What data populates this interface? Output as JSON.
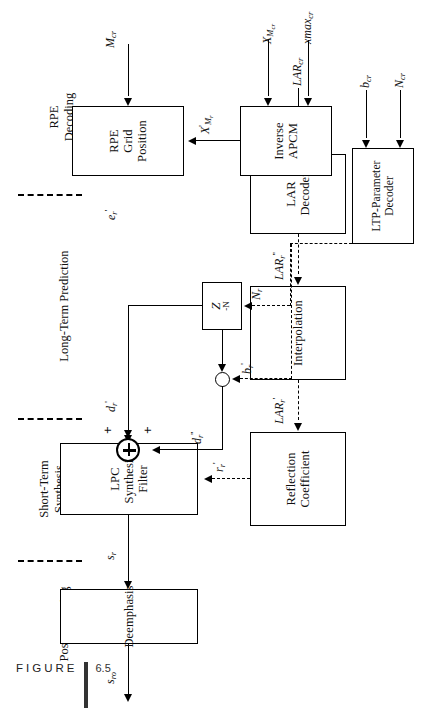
{
  "figure": {
    "caption_word": "FIGURE",
    "caption_number": "6.5",
    "caption_text": "Block Diagram of the RPE-LTP Decoder."
  },
  "sections": [
    {
      "id": "postprocessing",
      "title": "Postprocessing"
    },
    {
      "id": "short-term",
      "title": "Short-Term\nSynthesis\nFiltering"
    },
    {
      "id": "long-term",
      "title": "Long-Term Prediction"
    },
    {
      "id": "rpe-decoding",
      "title": "RPE\nDecoding"
    }
  ],
  "blocks": [
    {
      "id": "deemphasis",
      "lines": [
        "Deemphasis"
      ]
    },
    {
      "id": "lpc-synthesis-filter",
      "lines": [
        "LPC",
        "Synthesis",
        "Filter"
      ]
    },
    {
      "id": "reflection-coefficient",
      "lines": [
        "Reflection",
        "Coefficient"
      ]
    },
    {
      "id": "interpolation",
      "lines": [
        "Interpolation"
      ]
    },
    {
      "id": "lar-decoder",
      "lines": [
        "LAR",
        "Decoder"
      ]
    },
    {
      "id": "delay",
      "lines": [
        "Z^-N"
      ]
    },
    {
      "id": "ltp-parameter-decoder",
      "lines": [
        "LTP-Parameter",
        "Decoder"
      ]
    },
    {
      "id": "rpe-grid-position",
      "lines": [
        "RPE",
        "Grid",
        "Position"
      ]
    },
    {
      "id": "inverse-apcm",
      "lines": [
        "Inverse",
        "APCM"
      ]
    }
  ],
  "signals": {
    "s_ro": {
      "base": "s",
      "sub": "ro",
      "sup": ""
    },
    "s_r": {
      "base": "s",
      "sub": "r",
      "sup": ""
    },
    "d_r1": {
      "base": "d",
      "sub": "r",
      "sup": "'"
    },
    "d_r11": {
      "base": "d",
      "sub": "r",
      "sup": "''"
    },
    "e_r1": {
      "base": "e",
      "sub": "r",
      "sup": "'"
    },
    "r_r1": {
      "base": "r",
      "sub": "r",
      "sup": "'"
    },
    "lar_r1": {
      "base": "LAR",
      "sub": "r",
      "sup": "'"
    },
    "lar_r11": {
      "base": "LAR",
      "sub": "r",
      "sup": "''"
    },
    "lar_cr": {
      "base": "LAR",
      "sub": "cr",
      "sup": ""
    },
    "N_r": {
      "base": "N",
      "sub": "r",
      "sup": ""
    },
    "N_cr": {
      "base": "N",
      "sub": "cr",
      "sup": ""
    },
    "b_r1": {
      "base": "b",
      "sub": "r",
      "sup": "'"
    },
    "b_cr": {
      "base": "b",
      "sub": "cr",
      "sup": ""
    },
    "M_cr": {
      "base": "M",
      "sub": "cr",
      "sup": ""
    },
    "X_Mr1": {
      "base": "X",
      "sub": "Mr",
      "sup": "'"
    },
    "X_Mcr": {
      "base": "X",
      "sub": "Mcr",
      "sup": ""
    },
    "xmax_cr": {
      "base": "xmax",
      "sub": "cr",
      "sup": ""
    },
    "delay_z": {
      "base": "Z",
      "sub": "",
      "sup": "-N"
    }
  },
  "labels": {
    "s_ro": "s",
    "s_ro_sub": "ro",
    "s_r": "s",
    "s_r_sub": "r",
    "d_r1": "d",
    "d_r1_sub": "r",
    "d_r1_sup": "'",
    "d_r11": "d",
    "d_r11_sub": "r",
    "d_r11_sup": "''",
    "e_r1": "e",
    "e_r1_sub": "r",
    "e_r1_sup": "'",
    "r_r1": "r",
    "r_r1_sub": "r",
    "r_r1_sup": "'",
    "lar_r1": "LAR",
    "lar_r1_sub": "r",
    "lar_r1_sup": "'",
    "lar_r11": "LAR",
    "lar_r11_sub": "r",
    "lar_r11_sup": "''",
    "lar_cr": "LAR",
    "lar_cr_sub": "cr",
    "N_r": "N",
    "N_r_sub": "r",
    "N_cr": "N",
    "N_cr_sub": "cr",
    "b_r1": "b",
    "b_r1_sub": "r",
    "b_r1_sup": "'",
    "b_cr": "b",
    "b_cr_sub": "cr",
    "M_cr": "M",
    "M_cr_sub": "cr",
    "X_Mr1": "X",
    "X_Mr1_sub": "M",
    "X_Mr1_sub2": "r",
    "X_Mr1_sup": "'",
    "X_Mcr": "X",
    "X_Mcr_sub": "M",
    "X_Mcr_sub2": "cr",
    "xmax_cr": "xmax",
    "xmax_cr_sub": "cr",
    "delay_z": "Z",
    "delay_z_sup": "-N",
    "plus_a": "+",
    "plus_b": "+"
  },
  "block_text": {
    "deemphasis": "Deemphasis",
    "lpc_l1": "LPC",
    "lpc_l2": "Synthesis",
    "lpc_l3": "Filter",
    "refl_l1": "Reflection",
    "refl_l2": "Coefficient",
    "interpolation": "Interpolation",
    "lar_l1": "LAR",
    "lar_l2": "Decoder",
    "ltp_l1": "LTP-Parameter",
    "ltp_l2": "Decoder",
    "rpe_l1": "RPE",
    "rpe_l2": "Grid",
    "rpe_l3": "Position",
    "inv_l1": "Inverse",
    "inv_l2": "APCM"
  },
  "section_text": {
    "postprocessing": "Postprocessing",
    "short_l1": "Short-Term",
    "short_l2": "Synthesis",
    "short_l3": "Filtering",
    "long_term": "Long-Term Prediction",
    "rpe_l1": "RPE",
    "rpe_l2": "Decoding"
  },
  "colors": {
    "ink": "#000000",
    "paper": "#ffffff",
    "caption_rule": "#333333"
  }
}
